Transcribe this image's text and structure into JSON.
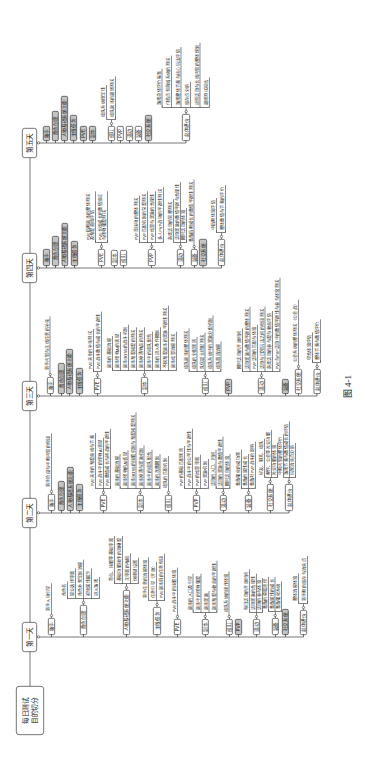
{
  "figure": {
    "root": "每日测试\n目的切分",
    "caption": "图 4-1",
    "colors": {
      "line": "#333333",
      "box_fill": "#ffffff",
      "greyed_fill": "#c4c4c4"
    },
    "days": [
      {
        "label": "第一天",
        "children": [
          {
            "label": "新手",
            "greyed": false,
            "leaves": [
              "新手入场引导"
            ]
          },
          {
            "label": "角色创建",
            "greyed": false,
            "leaves": [
              "角色名",
              "职业选择界面",
              "角色外观定制流程",
              "初始属性展示",
              "进入游戏"
            ]
          },
          {
            "label": "人物基础系统功能",
            "greyed": false,
            "leaves": [
              "背包、技能等基础界面",
              "基础功能操作的流畅度",
              "主界面的布局",
              "快捷键设置"
            ]
          },
          {
            "label": "主线任务",
            "greyed": false,
            "leaves": [
              "新手任务的流程体验",
              "任务引导（开放）",
              "PVE副本前的任务衔接"
            ]
          },
          {
            "label": "PVE",
            "greyed": false,
            "leaves": [
              "PVE战斗中的技能体验"
            ]
          },
          {
            "label": "副本",
            "greyed": false,
            "leaves": [
              "副本的入口及引导",
              "副本中的怪物强度",
              "副本奖励",
              "副本难度与收益的平衡性"
            ]
          },
          {
            "label": "组队",
            "greyed": false,
            "leaves": [
              "组队系统的操作体验"
            ]
          },
          {
            "label": "PVP",
            "greyed": true,
            "leaves": []
          },
          {
            "label": "活动",
            "greyed": false,
            "leaves": [
              "每日活动的开放时间",
              "活动奖励的合理性",
              "活动的参与体验"
            ]
          },
          {
            "label": "装备",
            "greyed": false,
            "leaves": [
              "装备的获取途径",
              "装备属性的成长",
              "装备强化系统"
            ]
          },
          {
            "label": "社交系统",
            "greyed": true,
            "leaves": []
          },
          {
            "label": "总体评价",
            "greyed": false,
            "leaves": [
              "整体流程体验",
              "新手期的留存与流失点"
            ]
          }
        ]
      },
      {
        "label": "第二天",
        "children": [
          {
            "label": "新手",
            "greyed": false,
            "leaves": [
              "新手阶段与中期内容的衔接"
            ]
          },
          {
            "label": "角色创建",
            "greyed": true,
            "leaves": []
          },
          {
            "label": "人物基础系统功能",
            "greyed": true,
            "leaves": []
          },
          {
            "label": "主线任务",
            "greyed": true,
            "leaves": []
          },
          {
            "label": "PVE",
            "greyed": false,
            "leaves": [
              "PVE关卡的难度曲线与节奏",
              "PVE战斗中的怪物AI表现",
              "PVE数值成长与挑战的平衡性"
            ]
          },
          {
            "label": "副本",
            "greyed": false,
            "leaves": [
              "副本的基础流程",
              "副本怪物的AI表现",
              "副本BOSS的技能机制与难度梯度测试",
              "副本掉落与奖励机制",
              "副本中的组队配合",
              "副本的次数限制"
            ]
          },
          {
            "label": "组队",
            "greyed": false,
            "leaves": [
              "组队的匹配机制"
            ]
          },
          {
            "label": "PVP",
            "greyed": false,
            "leaves": [
              "PVP的基础匹配规则",
              "PVP战斗中的公平性与平衡性",
              "PVP的结算界面",
              "PVP奖励机制"
            ]
          },
          {
            "label": "活动",
            "greyed": false,
            "leaves": [
              "活动的入口、时间",
              "活动的奖励与数值平衡性",
              "限时活动的体验"
            ]
          },
          {
            "label": "装备",
            "greyed": false,
            "leaves": [
              "装备强化的成功率",
              "装备的属性成长",
              "装备对PVP战斗的影响"
            ]
          },
          {
            "label": "社交系统",
            "greyed": false,
            "leaves": [
              "好友、聊天、组队",
              "邮件、公会等社交功能",
              "社交功能的体验"
            ]
          },
          {
            "label": "总体评价",
            "greyed": false,
            "leaves": [
              "中期内容的整体评价",
              "游戏节奏与数值成长的评估",
              "玩家流失点分析"
            ]
          }
        ]
      },
      {
        "label": "第三天",
        "children": [
          {
            "label": "新手",
            "greyed": false,
            "leaves": [
              "新手内容与主线任务的补充"
            ]
          },
          {
            "label": "角色创建",
            "greyed": true,
            "leaves": []
          },
          {
            "label": "人物基础系统功能",
            "greyed": true,
            "leaves": []
          },
          {
            "label": "主线任务",
            "greyed": true,
            "leaves": []
          },
          {
            "label": "PVE",
            "greyed": false,
            "leaves": [
              "PVE关卡的补充测试",
              "PVE战斗数值与成长的平衡性"
            ]
          },
          {
            "label": "副本",
            "greyed": false,
            "leaves": [
              "副本的基础流程",
              "副本怪物AI的表现",
              "副本BOSS的战斗机制",
              "副本难度梯度的测试",
              "副本掉落物品的测试",
              "副本中的组队配合",
              "副本的进入条件限制",
              "不同难度副本的奖励平衡性测试",
              "副本结算流程测试"
            ]
          },
          {
            "label": "组队",
            "greyed": false,
            "leaves": [
              "组队副本的整体测试",
              "组队的分配规则",
              "队伍职业搭配测试",
              "组队系统中的奖励分配机制",
              "组队邀请流程"
            ]
          },
          {
            "label": "PVP",
            "greyed": true,
            "leaves": []
          },
          {
            "label": "活动",
            "greyed": false,
            "leaves": [
              "限时活动的开放时间",
              "活动奖励与数值平衡的整体测试",
              "PVP活动的匹配与体验",
              "活动与日常玩法之间的衔接测试",
              "各类活动的参与度与收益评估",
              "PVE与PVP活动中的数值平衡性与参与体验测试"
            ]
          },
          {
            "label": "装备",
            "greyed": true,
            "leaves": []
          },
          {
            "label": "社交系统",
            "greyed": false,
            "leaves": [
              "公会系统的整体测试（公会战）"
            ]
          },
          {
            "label": "总体评价",
            "greyed": false,
            "leaves": [
              "综合体验评估",
              "整体节奏与数值评价"
            ]
          }
        ]
      },
      {
        "label": "第四天",
        "children": [
          {
            "label": "新手",
            "greyed": true,
            "leaves": []
          },
          {
            "label": "角色创建",
            "greyed": true,
            "leaves": []
          },
          {
            "label": "人物基础系统功能",
            "greyed": true,
            "leaves": []
          },
          {
            "label": "主线任务",
            "greyed": true,
            "leaves": []
          },
          {
            "label": "PVE",
            "greyed": false,
            "leaves": [
              "PVE后期副本的整体测试\n及难度曲线评估",
              "PVE长线成长的数值验证\n与怪物强度测试"
            ]
          },
          {
            "label": "副本",
            "greyed": false,
            "leaves": []
          },
          {
            "label": "组队",
            "greyed": false,
            "leaves": []
          },
          {
            "label": "PVP",
            "greyed": false,
            "leaves": [
              "PVP竞技场的整体测试",
              "PVP匹配机制的深度测试",
              "PVP结算与奖励的合理性",
              "多人PVP战场的平衡性测试"
            ]
          },
          {
            "label": "活动",
            "greyed": false,
            "leaves": [
              "各类活动的完整测试",
              "活动奖励的数值平衡与合理性",
              "限时活动的体验"
            ]
          },
          {
            "label": "装备",
            "greyed": false,
            "leaves": [
              "装备后期成长的数值平衡性测试"
            ]
          },
          {
            "label": "社交系统",
            "greyed": true,
            "leaves": []
          },
          {
            "label": "总体评价",
            "greyed": false,
            "leaves": [
              "中后期体验评估",
              "整体数值与节奏的评价"
            ]
          }
        ]
      },
      {
        "label": "第五天",
        "children": [
          {
            "label": "新手",
            "greyed": true,
            "leaves": []
          },
          {
            "label": "角色创建",
            "greyed": true,
            "leaves": []
          },
          {
            "label": "人物基础系统功能",
            "greyed": true,
            "leaves": []
          },
          {
            "label": "主线任务",
            "greyed": true,
            "leaves": []
          },
          {
            "label": "PVE",
            "greyed": true,
            "leaves": []
          },
          {
            "label": "副本",
            "greyed": true,
            "leaves": []
          },
          {
            "label": "组队",
            "greyed": false,
            "leaves": [
              "组队系统稳定性",
              "组队副本的最终测试"
            ]
          },
          {
            "label": "PVP",
            "greyed": false,
            "leaves": []
          },
          {
            "label": "活动",
            "greyed": false,
            "leaves": []
          },
          {
            "label": "装备",
            "greyed": false,
            "leaves": []
          },
          {
            "label": "社交系统",
            "greyed": true,
            "leaves": []
          },
          {
            "label": "总体评价",
            "greyed": false,
            "leaves": [
              "游戏总体评价标准",
              "付费点和商城系统的测试",
              "游戏整体节奏与核心玩法评估",
              "留存点分析",
              "运营活动与长线内容的整体规划",
              "最终测试报告"
            ]
          }
        ]
      }
    ]
  }
}
